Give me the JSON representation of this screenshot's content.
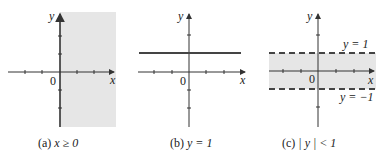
{
  "figure": {
    "panels": [
      {
        "id": "a",
        "caption_prefix": "(a)",
        "caption_math": "x ≥ 0",
        "region": "x >= 0 shaded",
        "x_axis_label": "x",
        "y_axis_label": "y",
        "origin_label": "0"
      },
      {
        "id": "b",
        "caption_prefix": "(b)",
        "caption_math": "y = 1",
        "line": "y = 1 solid",
        "x_axis_label": "x",
        "y_axis_label": "y",
        "origin_label": "0"
      },
      {
        "id": "c",
        "caption_prefix": "(c)",
        "caption_math": "| y | < 1",
        "region": "-1 < y < 1 shaded, boundaries dashed",
        "upper_boundary_label": "y = 1",
        "lower_boundary_label": "y = −1",
        "x_axis_label": "x",
        "y_axis_label": "y",
        "origin_label": "0"
      }
    ],
    "colors": {
      "shade": "#e6e6e6",
      "axis": "#333333",
      "line": "#444444"
    }
  }
}
